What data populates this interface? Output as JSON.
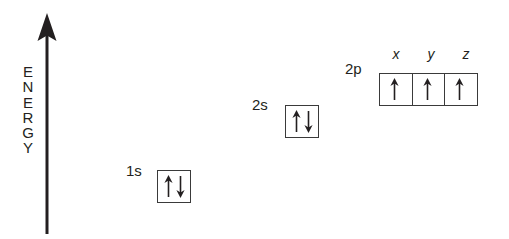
{
  "diagram": {
    "background_color": "#ffffff",
    "line_color": "#3a3a3a",
    "text_color": "#231f20"
  },
  "axis": {
    "name": "energy-axis",
    "label_letters": [
      "E",
      "N",
      "E",
      "R",
      "G",
      "Y"
    ],
    "label_text": "ENERGY",
    "direction": "up",
    "arrow_icon": "up-arrow-icon"
  },
  "orbitals": [
    {
      "id": "1s",
      "label": "1s",
      "boxes": [
        {
          "sublabel": "",
          "electrons": [
            "up",
            "down"
          ]
        }
      ]
    },
    {
      "id": "2s",
      "label": "2s",
      "boxes": [
        {
          "sublabel": "",
          "electrons": [
            "up",
            "down"
          ]
        }
      ]
    },
    {
      "id": "2p",
      "label": "2p",
      "boxes": [
        {
          "sublabel": "x",
          "electrons": [
            "up"
          ]
        },
        {
          "sublabel": "y",
          "electrons": [
            "up"
          ]
        },
        {
          "sublabel": "z",
          "electrons": [
            "up"
          ]
        }
      ]
    }
  ]
}
